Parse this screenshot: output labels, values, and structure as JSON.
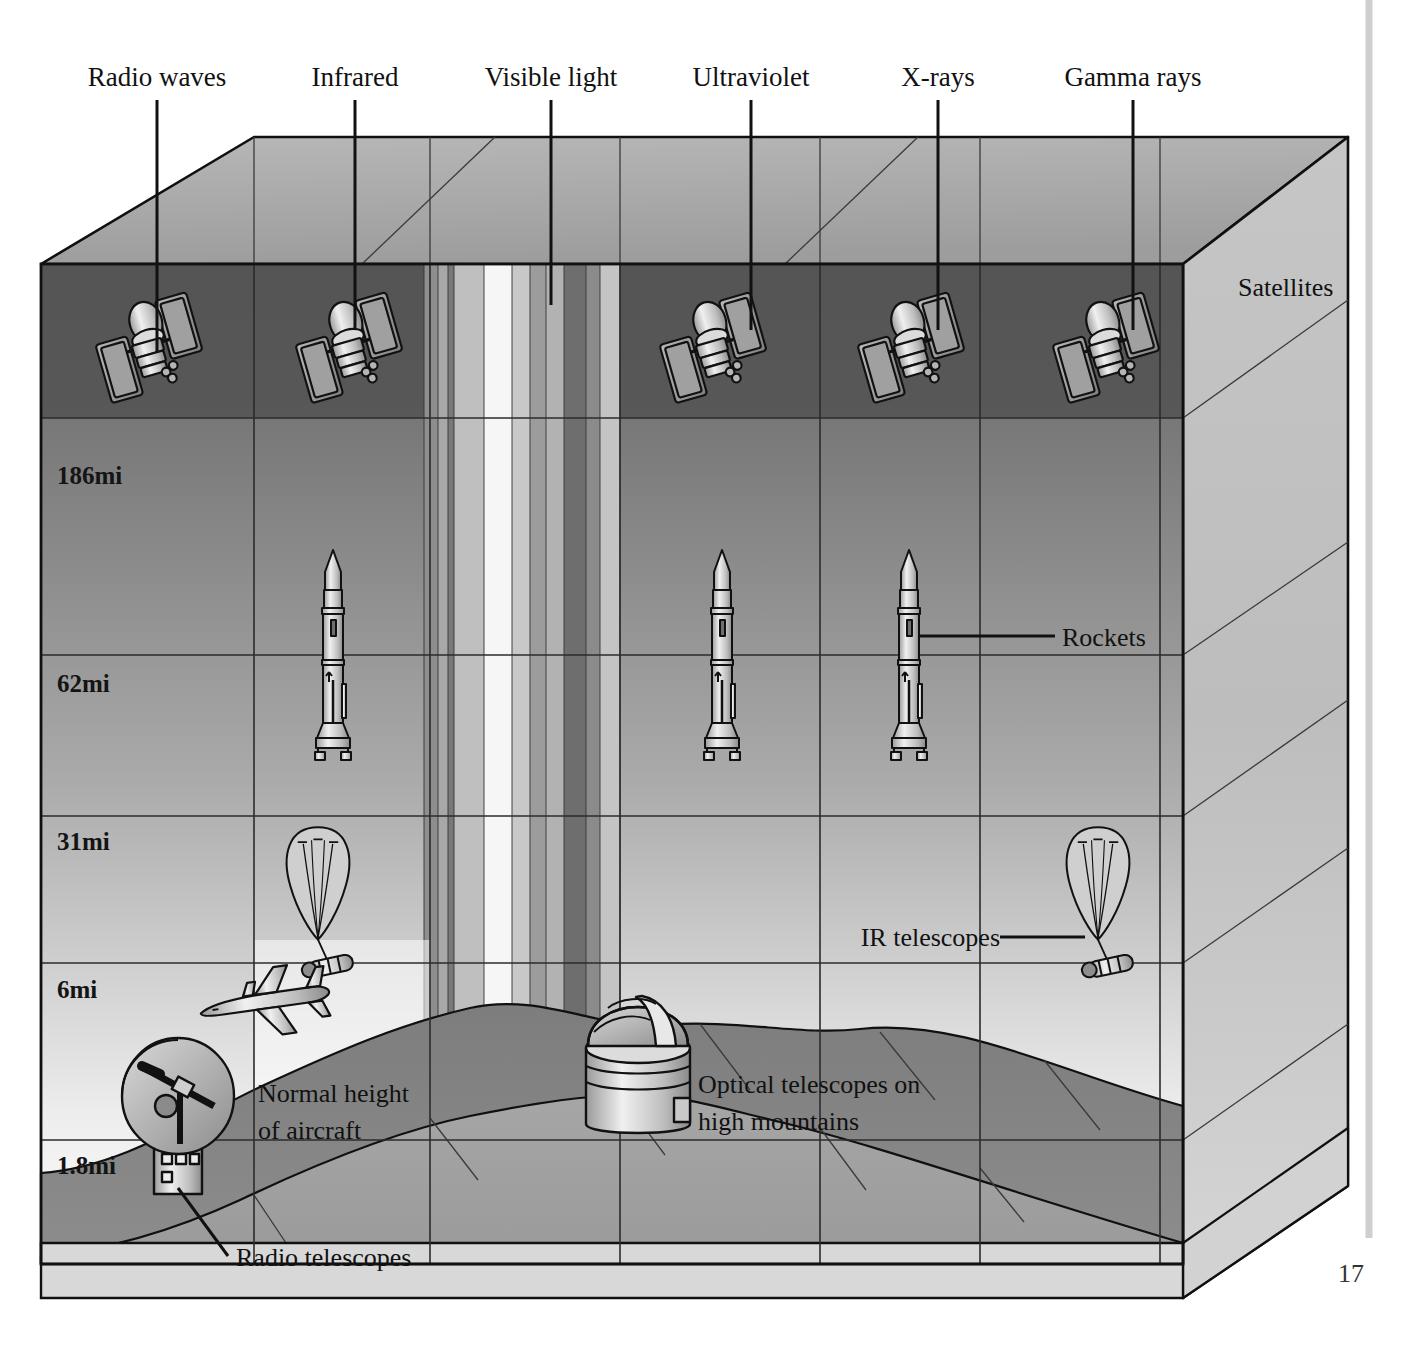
{
  "figure": {
    "page_number": "17"
  },
  "spectrum_labels": [
    {
      "id": "radio",
      "text": "Radio waves",
      "x": 157,
      "label_x": 157,
      "label_y": 86,
      "leader_y1": 100,
      "leader_y2": 352
    },
    {
      "id": "infrared",
      "text": "Infrared",
      "x": 355,
      "label_x": 355,
      "label_y": 86,
      "leader_y1": 100,
      "leader_y2": 330
    },
    {
      "id": "visible",
      "text": "Visible light",
      "x": 551,
      "label_x": 551,
      "label_y": 86,
      "leader_y1": 100,
      "leader_y2": 305
    },
    {
      "id": "ultraviolet",
      "text": "Ultraviolet",
      "x": 751,
      "label_x": 751,
      "label_y": 86,
      "leader_y1": 100,
      "leader_y2": 330
    },
    {
      "id": "xrays",
      "text": "X-rays",
      "x": 938,
      "label_x": 938,
      "label_y": 86,
      "leader_y1": 100,
      "leader_y2": 330
    },
    {
      "id": "gammarays",
      "text": "Gamma rays",
      "x": 1133,
      "label_x": 1133,
      "label_y": 86,
      "leader_y1": 100,
      "leader_y2": 330
    }
  ],
  "altitude_axis": {
    "unit": "mi",
    "ticks": [
      {
        "value": "186mi",
        "y": 480,
        "line_y": 418
      },
      {
        "value": "62mi",
        "y": 688,
        "line_y": 655
      },
      {
        "value": "31mi",
        "y": 845,
        "line_y": 816
      },
      {
        "value": "6mi",
        "y": 992,
        "line_y": 963
      },
      {
        "value": "1.8mi",
        "y": 1168,
        "line_y": 1140
      }
    ]
  },
  "callouts": [
    {
      "id": "satellites",
      "text": "Satellites",
      "x": 1238,
      "y": 292,
      "anchor": "start",
      "leader": null
    },
    {
      "id": "rockets",
      "text": "Rockets",
      "x": 1062,
      "y": 645,
      "anchor": "start",
      "leader": {
        "x1": 918,
        "y1": 636,
        "x2": 1055,
        "y2": 636
      }
    },
    {
      "id": "ir-telescopes",
      "text": "IR telescopes",
      "x": 833,
      "y": 945,
      "anchor": "start",
      "leader": {
        "x1": 1000,
        "y1": 937,
        "x2": 1085,
        "y2": 937
      }
    },
    {
      "id": "optical-telescopes",
      "text": "Optical telescopes on",
      "x": 698,
      "y": 1093,
      "anchor": "start",
      "leader": null
    },
    {
      "id": "optical-telescopes-2",
      "text": "high mountains",
      "x": 698,
      "y": 1130,
      "anchor": "start",
      "leader": null
    },
    {
      "id": "aircraft-1",
      "text": "Normal height",
      "x": 258,
      "y": 1102,
      "anchor": "start",
      "leader": null
    },
    {
      "id": "aircraft-2",
      "text": "of aircraft",
      "x": 258,
      "y": 1139,
      "anchor": "start",
      "leader": null
    },
    {
      "id": "radio-telescopes",
      "text": "Radio telescopes",
      "x": 238,
      "y": 1262,
      "anchor": "start",
      "leader": {
        "x1": 178,
        "y1": 1190,
        "x2": 228,
        "y2": 1256
      }
    }
  ],
  "instruments": {
    "satellites": {
      "label": "satellite-icon",
      "xs": [
        148,
        348,
        712,
        912,
        1107
      ],
      "y": 345
    },
    "rockets": {
      "label": "rocket-icon",
      "xs": [
        333,
        722,
        909
      ],
      "y": 655
    },
    "balloons": {
      "label": "balloon-icon",
      "xs": [
        325,
        1103
      ],
      "y": 890
    },
    "aircraft": {
      "label": "airplane-icon",
      "x": 258,
      "y": 1003
    },
    "radio_dish": {
      "label": "radio-telescope-icon",
      "x": 178,
      "y": 1100
    },
    "optical_dome": {
      "label": "optical-telescope-icon",
      "x": 638,
      "y": 1040
    }
  },
  "colors": {
    "front_top": "#6f6f6f",
    "front_bottom": "#ffffff",
    "top_face": "#a8a8a8",
    "side_face": "#b6b6b6",
    "ground_near": "#9b9b9b",
    "ground_far": "#767676",
    "window_bright": "#f2f2f2",
    "opaque_dark": "#4a4a4a",
    "stroke": "#101010"
  },
  "window_columns": [
    {
      "id": "w1",
      "x": 424,
      "w": 14,
      "shade": "#8e8e8e"
    },
    {
      "id": "w2",
      "x": 438,
      "w": 10,
      "shade": "#a5a5a5"
    },
    {
      "id": "w3",
      "x": 448,
      "w": 6,
      "shade": "#7b7b7b"
    },
    {
      "id": "w4",
      "x": 454,
      "w": 30,
      "shade": "#bdbdbd"
    },
    {
      "id": "w5",
      "x": 484,
      "w": 28,
      "shade": "#f5f5f5"
    },
    {
      "id": "w6",
      "x": 512,
      "w": 18,
      "shade": "#c6c6c6"
    },
    {
      "id": "w7",
      "x": 530,
      "w": 16,
      "shade": "#9a9a9a"
    },
    {
      "id": "w8",
      "x": 546,
      "w": 18,
      "shade": "#b0b0b0"
    },
    {
      "id": "w9",
      "x": 564,
      "w": 22,
      "shade": "#707070"
    },
    {
      "id": "w10",
      "x": 586,
      "w": 14,
      "shade": "#8a8a8a"
    },
    {
      "id": "w11",
      "x": 600,
      "w": 20,
      "shade": "#c2c2c2"
    }
  ]
}
